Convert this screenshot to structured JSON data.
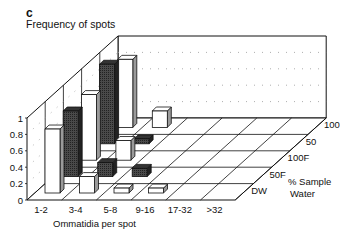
{
  "panel_label": "c",
  "chart_data": {
    "type": "bar",
    "subtype": "3d-bar",
    "title": "Frequency of spots",
    "xlabel": "Ommatidia per spot",
    "zlabel": "% Sample Water",
    "ylabel": "",
    "ylim": [
      0,
      1
    ],
    "yticks": [
      "0",
      "0.2",
      "0.4",
      "0.6",
      "0.8",
      "1"
    ],
    "ytick_values": [
      0,
      0.2,
      0.4,
      0.6,
      0.8,
      1
    ],
    "grid": true,
    "categories": [
      "1-2",
      "3-4",
      "5-8",
      "9-16",
      "17-32",
      ">32"
    ],
    "series": [
      {
        "name": "DW",
        "pattern": "white",
        "values": [
          0.78,
          0.2,
          0.06,
          0.06,
          0,
          0
        ]
      },
      {
        "name": "50F",
        "pattern": "dark",
        "values": [
          0.8,
          0.17,
          0.1,
          0,
          0,
          0
        ]
      },
      {
        "name": "100F",
        "pattern": "white",
        "values": [
          0.8,
          0.24,
          0,
          0,
          0,
          0
        ]
      },
      {
        "name": "50",
        "pattern": "dark",
        "values": [
          0.97,
          0.06,
          0,
          0,
          0,
          0
        ]
      },
      {
        "name": "100",
        "pattern": "white",
        "values": [
          0.83,
          0.2,
          0,
          0,
          0,
          0
        ]
      }
    ],
    "colors": {
      "white_bar": "#ffffff",
      "dark_bar": "#3a3a3a",
      "side": "#9a9a9a",
      "line": "#111111"
    }
  }
}
